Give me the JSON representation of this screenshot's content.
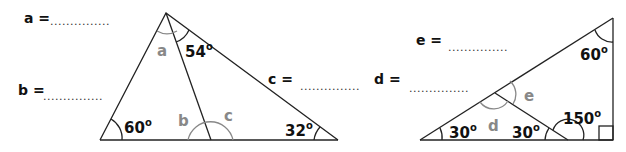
{
  "answers": {
    "a": {
      "label": "a =",
      "blank": "...............",
      "value": ""
    },
    "b": {
      "label": "b =",
      "blank": "...............",
      "value": ""
    },
    "c": {
      "label": "c =",
      "blank": "...............",
      "value": ""
    },
    "d": {
      "label": "d =",
      "blank": "...............",
      "value": ""
    },
    "e": {
      "label": "e =",
      "blank": "...............",
      "value": ""
    }
  },
  "figure1": {
    "angles": {
      "top_right": "54",
      "bottom_left": "60",
      "bottom_right": "32"
    },
    "unknowns": {
      "a": "a",
      "b": "b",
      "c": "c"
    },
    "degree": "o"
  },
  "figure2": {
    "angles": {
      "top": "60",
      "bottom_left": "30",
      "middle": "30",
      "exterior": "150"
    },
    "unknowns": {
      "d": "d",
      "e": "e"
    },
    "degree": "o"
  }
}
